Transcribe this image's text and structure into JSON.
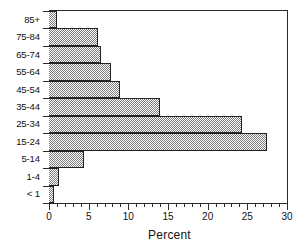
{
  "chart_data": {
    "type": "bar",
    "orientation": "horizontal",
    "title": "",
    "xlabel": "Percent",
    "ylabel": "",
    "categories": [
      "< 1",
      "1-4",
      "5-14",
      "15-24",
      "25-34",
      "35-44",
      "45-54",
      "55-64",
      "65-74",
      "75-84",
      "85+"
    ],
    "values": [
      0.6,
      1.2,
      4.4,
      27.5,
      24.3,
      14.0,
      8.9,
      7.8,
      6.5,
      6.2,
      1.0
    ],
    "xlim": [
      0,
      30
    ],
    "xticks": [
      0,
      5,
      10,
      15,
      20,
      25,
      30
    ],
    "xtick_labels": [
      "0",
      "5",
      "10",
      "15",
      "20",
      "25",
      "30"
    ],
    "xtick_minor_step": 1,
    "grid": false,
    "legend": null,
    "bar_fill": "#808080",
    "bar_fill_style": "50% dither checkerboard",
    "bar_edge_color": "#232323",
    "frame_color": "#2b2b2b",
    "background": "#ffffff"
  },
  "axes": {
    "x_title": "Percent",
    "x_tick_labels": [
      "0",
      "5",
      "10",
      "15",
      "20",
      "25",
      "30"
    ],
    "y_tick_labels_top_to_bottom": [
      "85+",
      "75-84",
      "65-74",
      "55-64",
      "45-54",
      "35-44",
      "25-34",
      "15-24",
      "5-14",
      "1-4",
      "< 1"
    ]
  }
}
